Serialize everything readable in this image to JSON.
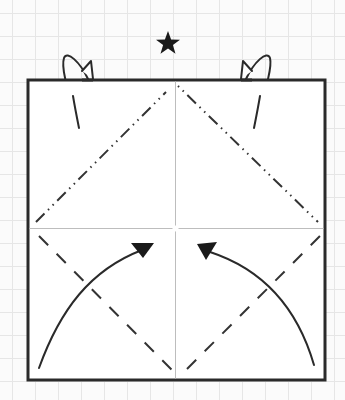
{
  "diagram": {
    "type": "origami-fold-diagram",
    "background": {
      "style": "graph-paper-grid",
      "grid_color": "#e6e6e6",
      "paper_color": "#fbfbfb",
      "grid_spacing_px": 23
    },
    "symbols": {
      "top_marker": {
        "icon": "star-icon",
        "color": "#1a1a1a"
      }
    },
    "paper_square": {
      "border_color": "#2a2a2a",
      "fill_color": "#ffffff"
    },
    "crease_lines": [
      {
        "name": "vertical-center-crease",
        "style": "existing-crease",
        "color": "#bdbdbd"
      },
      {
        "name": "horizontal-center-crease",
        "style": "existing-crease",
        "color": "#bdbdbd"
      },
      {
        "name": "upper-left-diagonal",
        "style": "mountain-fold",
        "pattern": "dash-dot-dot"
      },
      {
        "name": "upper-right-diagonal",
        "style": "mountain-fold",
        "pattern": "dash-dot-dot"
      },
      {
        "name": "lower-left-diagonal",
        "style": "valley-fold",
        "pattern": "dashed"
      },
      {
        "name": "lower-right-diagonal",
        "style": "valley-fold",
        "pattern": "dashed"
      }
    ],
    "arrows": [
      {
        "name": "fold-arrow-left",
        "direction": "lower-left corner to center"
      },
      {
        "name": "fold-arrow-right",
        "direction": "lower-right corner to center"
      },
      {
        "name": "flap-arrow-left",
        "direction": "upper-left corner folded behind"
      },
      {
        "name": "flap-arrow-right",
        "direction": "upper-right corner folded behind"
      }
    ],
    "line_color": "#2a2a2a"
  }
}
